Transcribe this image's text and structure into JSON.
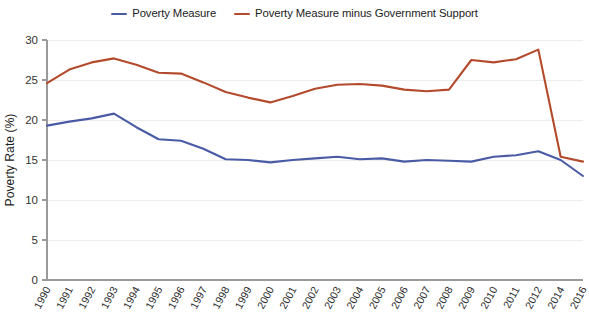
{
  "chart_data": {
    "type": "line",
    "title": "",
    "xlabel": "",
    "ylabel": "Poverty Rate (%)",
    "ylim": [
      0,
      30
    ],
    "yticks": [
      0,
      5,
      10,
      15,
      20,
      25,
      30
    ],
    "grid": "horizontal",
    "legend_position": "top-center",
    "categories": [
      "1990",
      "1991",
      "1992",
      "1993",
      "1994",
      "1995",
      "1996",
      "1997",
      "1998",
      "1999",
      "2000",
      "2001",
      "2002",
      "2003",
      "2004",
      "2005",
      "2006",
      "2007",
      "2008",
      "2009",
      "2010",
      "2011",
      "2012",
      "2014",
      "2016"
    ],
    "series": [
      {
        "name": "Poverty Measure",
        "color": "#4A5BA6",
        "values": [
          19.3,
          19.8,
          20.2,
          20.8,
          19.1,
          17.6,
          17.4,
          16.4,
          15.1,
          15.0,
          14.7,
          15.0,
          15.2,
          15.4,
          15.1,
          15.2,
          14.8,
          15.0,
          14.9,
          14.8,
          15.4,
          15.6,
          16.1,
          15.0,
          13.0
        ]
      },
      {
        "name": "Poverty Measure minus Government Support",
        "color": "#B44A2C",
        "values": [
          24.6,
          26.3,
          27.2,
          27.7,
          26.9,
          25.9,
          25.8,
          24.7,
          23.5,
          22.8,
          22.2,
          23.0,
          23.9,
          24.4,
          24.5,
          24.3,
          23.8,
          23.6,
          23.8,
          27.5,
          27.2,
          27.6,
          28.8,
          15.4,
          14.8
        ]
      }
    ]
  },
  "legend": {
    "entries": [
      {
        "label": "Poverty Measure",
        "color": "#4A5BA6"
      },
      {
        "label": "Poverty Measure minus Government Support",
        "color": "#B44A2C"
      }
    ]
  },
  "axes": {
    "y_title": "Poverty Rate (%)"
  }
}
